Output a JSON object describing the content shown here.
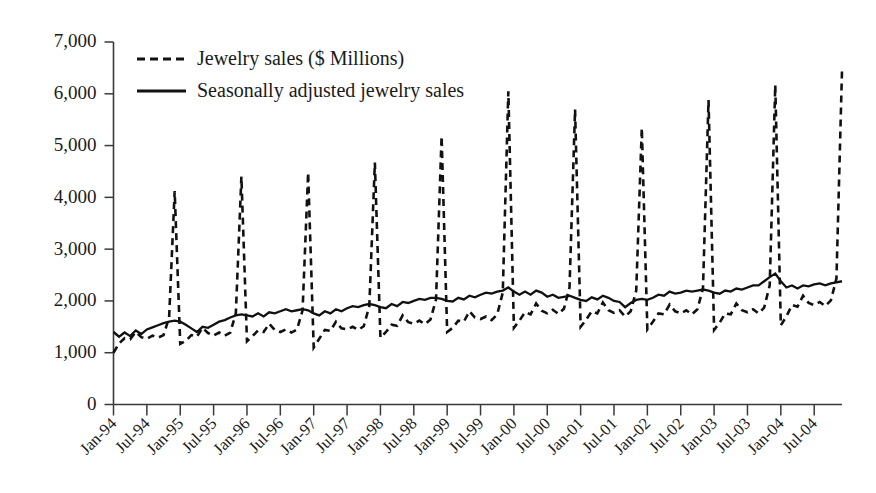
{
  "chart_data": {
    "type": "line",
    "title": "",
    "xlabel": "",
    "ylabel": "",
    "ylim": [
      0,
      7000
    ],
    "yticks": [
      0,
      1000,
      2000,
      3000,
      4000,
      5000,
      6000,
      7000
    ],
    "ytick_labels": [
      "0",
      "1,000",
      "2,000",
      "3,000",
      "4,000",
      "5,000",
      "6,000",
      "7,000"
    ],
    "grid": false,
    "legend_position": "top-left",
    "legend": [
      "Jewelry sales ($ Millions)",
      "Seasonally adjusted jewelry sales"
    ],
    "xtick_labels": [
      "Jan-94",
      "Jul-94",
      "Jan-95",
      "Jul-95",
      "Jan-96",
      "Jul-96",
      "Jan-97",
      "Jul-97",
      "Jan-98",
      "Jul-98",
      "Jan-99",
      "Jul-99",
      "Jan-00",
      "Jul-00",
      "Jan-01",
      "Jul-01",
      "Jan-02",
      "Jul-02",
      "Jan-03",
      "Jul-03",
      "Jan-04",
      "Jul-04"
    ],
    "xtick_indices": [
      0,
      6,
      12,
      18,
      24,
      30,
      36,
      42,
      48,
      54,
      60,
      66,
      72,
      78,
      84,
      90,
      96,
      102,
      108,
      114,
      120,
      126
    ],
    "x": [
      "Jan-94",
      "Feb-94",
      "Mar-94",
      "Apr-94",
      "May-94",
      "Jun-94",
      "Jul-94",
      "Aug-94",
      "Sep-94",
      "Oct-94",
      "Nov-94",
      "Dec-94",
      "Jan-95",
      "Feb-95",
      "Mar-95",
      "Apr-95",
      "May-95",
      "Jun-95",
      "Jul-95",
      "Aug-95",
      "Sep-95",
      "Oct-95",
      "Nov-95",
      "Dec-95",
      "Jan-96",
      "Feb-96",
      "Mar-96",
      "Apr-96",
      "May-96",
      "Jun-96",
      "Jul-96",
      "Aug-96",
      "Sep-96",
      "Oct-96",
      "Nov-96",
      "Dec-96",
      "Jan-97",
      "Feb-97",
      "Mar-97",
      "Apr-97",
      "May-97",
      "Jun-97",
      "Jul-97",
      "Aug-97",
      "Sep-97",
      "Oct-97",
      "Nov-97",
      "Dec-97",
      "Jan-98",
      "Feb-98",
      "Mar-98",
      "Apr-98",
      "May-98",
      "Jun-98",
      "Jul-98",
      "Aug-98",
      "Sep-98",
      "Oct-98",
      "Nov-98",
      "Dec-98",
      "Jan-99",
      "Feb-99",
      "Mar-99",
      "Apr-99",
      "May-99",
      "Jun-99",
      "Jul-99",
      "Aug-99",
      "Sep-99",
      "Oct-99",
      "Nov-99",
      "Dec-99",
      "Jan-00",
      "Feb-00",
      "Mar-00",
      "Apr-00",
      "May-00",
      "Jun-00",
      "Jul-00",
      "Aug-00",
      "Sep-00",
      "Oct-00",
      "Nov-00",
      "Dec-00",
      "Jan-01",
      "Feb-01",
      "Mar-01",
      "Apr-01",
      "May-01",
      "Jun-01",
      "Jul-01",
      "Aug-01",
      "Sep-01",
      "Oct-01",
      "Nov-01",
      "Dec-01",
      "Jan-02",
      "Feb-02",
      "Mar-02",
      "Apr-02",
      "May-02",
      "Jun-02",
      "Jul-02",
      "Aug-02",
      "Sep-02",
      "Oct-02",
      "Nov-02",
      "Dec-02",
      "Jan-03",
      "Feb-03",
      "Mar-03",
      "Apr-03",
      "May-03",
      "Jun-03",
      "Jul-03",
      "Aug-03",
      "Sep-03",
      "Oct-03",
      "Nov-03",
      "Dec-03",
      "Jan-04",
      "Feb-04",
      "Mar-04",
      "Apr-04",
      "May-04",
      "Jun-04",
      "Jul-04",
      "Aug-04",
      "Sep-04",
      "Oct-04",
      "Nov-04",
      "Dec-04"
    ],
    "series": [
      {
        "name": "Jewelry sales ($ Millions)",
        "style": "dashed",
        "values": [
          1000,
          1180,
          1280,
          1260,
          1400,
          1300,
          1270,
          1330,
          1290,
          1340,
          1680,
          4120,
          1170,
          1230,
          1340,
          1310,
          1480,
          1380,
          1330,
          1390,
          1330,
          1390,
          1760,
          4400,
          1220,
          1320,
          1430,
          1400,
          1560,
          1440,
          1400,
          1450,
          1390,
          1450,
          1820,
          4480,
          1100,
          1270,
          1440,
          1420,
          1600,
          1470,
          1450,
          1500,
          1440,
          1510,
          1900,
          4670,
          1290,
          1400,
          1540,
          1520,
          1720,
          1590,
          1560,
          1620,
          1550,
          1640,
          2030,
          5180,
          1400,
          1480,
          1620,
          1600,
          1800,
          1680,
          1650,
          1700,
          1630,
          1740,
          2160,
          6050,
          1480,
          1620,
          1780,
          1740,
          1950,
          1810,
          1760,
          1830,
          1750,
          1850,
          2260,
          5700,
          1500,
          1640,
          1800,
          1760,
          1970,
          1820,
          1770,
          1820,
          1700,
          1800,
          2200,
          5340,
          1450,
          1600,
          1760,
          1740,
          1930,
          1800,
          1760,
          1820,
          1740,
          1840,
          2240,
          5880,
          1440,
          1580,
          1760,
          1740,
          1950,
          1820,
          1780,
          1840,
          1760,
          1870,
          2300,
          6170,
          1530,
          1700,
          1920,
          1890,
          2100,
          1960,
          1920,
          1980,
          1900,
          2010,
          2430,
          6450
        ]
      },
      {
        "name": "Seasonally adjusted jewelry sales",
        "style": "solid",
        "values": [
          1400,
          1310,
          1390,
          1320,
          1430,
          1360,
          1450,
          1490,
          1530,
          1570,
          1600,
          1620,
          1600,
          1540,
          1470,
          1400,
          1500,
          1480,
          1540,
          1600,
          1630,
          1680,
          1720,
          1740,
          1720,
          1700,
          1760,
          1700,
          1780,
          1760,
          1800,
          1840,
          1800,
          1820,
          1840,
          1820,
          1760,
          1720,
          1800,
          1760,
          1840,
          1800,
          1860,
          1900,
          1880,
          1920,
          1940,
          1920,
          1880,
          1860,
          1940,
          1900,
          1980,
          1960,
          2000,
          2040,
          2020,
          2060,
          2060,
          2040,
          2000,
          1990,
          2060,
          2030,
          2100,
          2070,
          2120,
          2160,
          2140,
          2180,
          2200,
          2260,
          2180,
          2120,
          2180,
          2120,
          2200,
          2160,
          2080,
          2120,
          2060,
          2080,
          2100,
          2060,
          2020,
          2000,
          2070,
          2030,
          2100,
          2060,
          2000,
          1980,
          1880,
          1960,
          2020,
          2040,
          2020,
          2060,
          2120,
          2100,
          2180,
          2140,
          2160,
          2200,
          2180,
          2200,
          2220,
          2200,
          2160,
          2140,
          2200,
          2180,
          2240,
          2220,
          2260,
          2300,
          2300,
          2380,
          2460,
          2530,
          2380,
          2260,
          2300,
          2240,
          2300,
          2280,
          2320,
          2340,
          2300,
          2340,
          2360,
          2380
        ]
      }
    ]
  }
}
